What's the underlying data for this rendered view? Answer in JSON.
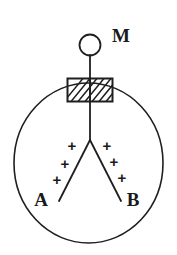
{
  "figure": {
    "background_color": "#ffffff",
    "ink_color": "#1f1f1f",
    "labels": {
      "knob": "M",
      "leaf_left": "A",
      "leaf_right": "B"
    },
    "charge_symbol": "+",
    "charges_left": [
      "+",
      "+",
      "+"
    ],
    "charges_right": [
      "+",
      "+",
      "+"
    ],
    "parts": {
      "vessel": "glass-globe",
      "stopper": "hatched-insulating-plug",
      "knob": "metal-knob-circle",
      "rod": "vertical-conducting-rod",
      "leaves": "diverging-leaf-pair"
    }
  }
}
